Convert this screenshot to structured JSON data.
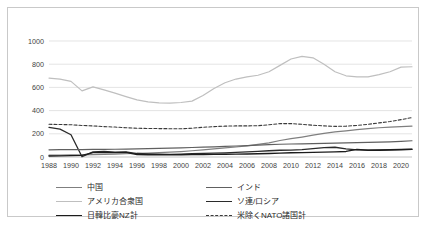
{
  "chart_data": {
    "type": "line",
    "title": "",
    "xlabel": "",
    "ylabel": "",
    "ylim": [
      0,
      1000
    ],
    "yticks": [
      0,
      200,
      400,
      600,
      800,
      1000
    ],
    "xlim": [
      1988,
      2021
    ],
    "grid": true,
    "legend_position": "bottom",
    "xtick_labels": [
      "1988",
      "1990",
      "1992",
      "1994",
      "1996",
      "1998",
      "2000",
      "2002",
      "2004",
      "2006",
      "2008",
      "2010",
      "2012",
      "2014",
      "2016",
      "2018",
      "2020"
    ],
    "x": [
      1988,
      1989,
      1990,
      1991,
      1992,
      1993,
      1994,
      1995,
      1996,
      1997,
      1998,
      1999,
      2000,
      2001,
      2002,
      2003,
      2004,
      2005,
      2006,
      2007,
      2008,
      2009,
      2010,
      2011,
      2012,
      2013,
      2014,
      2015,
      2016,
      2017,
      2018,
      2019,
      2020,
      2021
    ],
    "series": [
      {
        "name": "アメリカ合衆国",
        "key": "usa",
        "color": "#bfbfbf",
        "width": 1.2,
        "dash": "none",
        "values": [
          680,
          672,
          652,
          570,
          605,
          578,
          550,
          520,
          492,
          475,
          466,
          465,
          470,
          482,
          530,
          590,
          640,
          672,
          690,
          705,
          735,
          790,
          845,
          868,
          855,
          800,
          735,
          700,
          690,
          690,
          710,
          735,
          775,
          778
        ]
      },
      {
        "name": "米除くNATO諸国計",
        "key": "nato_ex_us",
        "color": "#3a3a3a",
        "width": 1.1,
        "dash": "3,2",
        "values": [
          282,
          280,
          278,
          272,
          268,
          262,
          258,
          252,
          248,
          246,
          245,
          244,
          243,
          248,
          256,
          262,
          266,
          268,
          268,
          270,
          278,
          288,
          288,
          282,
          274,
          268,
          264,
          266,
          272,
          282,
          294,
          306,
          322,
          340
        ]
      },
      {
        "name": "中国",
        "key": "china",
        "color": "#7f7f7f",
        "width": 1.2,
        "dash": "none",
        "values": [
          16,
          17,
          18,
          19,
          21,
          23,
          25,
          28,
          31,
          34,
          38,
          42,
          47,
          54,
          62,
          70,
          78,
          86,
          96,
          108,
          122,
          142,
          158,
          172,
          188,
          204,
          216,
          226,
          236,
          244,
          252,
          258,
          262,
          266
        ]
      },
      {
        "name": "ソ連/ロシア",
        "key": "ussr_russia",
        "color": "#2b2b2b",
        "width": 1.3,
        "dash": "none",
        "values": [
          255,
          240,
          192,
          2,
          44,
          48,
          42,
          44,
          30,
          26,
          24,
          23,
          25,
          28,
          32,
          34,
          36,
          40,
          44,
          48,
          54,
          58,
          60,
          64,
          72,
          80,
          84,
          70,
          62,
          60,
          62,
          64,
          66,
          68
        ]
      },
      {
        "name": "インド",
        "key": "india",
        "color": "#606060",
        "width": 1.2,
        "dash": "none",
        "values": [
          62,
          63,
          64,
          64,
          65,
          66,
          67,
          68,
          70,
          72,
          74,
          76,
          79,
          82,
          85,
          88,
          92,
          95,
          98,
          102,
          106,
          110,
          112,
          114,
          116,
          118,
          120,
          122,
          124,
          126,
          128,
          131,
          135,
          140
        ]
      },
      {
        "name": "日韓比豪NZ計",
        "key": "japan_group",
        "color": "#1c1c1c",
        "width": 1.4,
        "dash": "none",
        "values": [
          8,
          10,
          12,
          14,
          38,
          40,
          38,
          40,
          22,
          20,
          19,
          19,
          20,
          21,
          22,
          23,
          24,
          25,
          26,
          28,
          30,
          33,
          36,
          38,
          40,
          42,
          44,
          48,
          66,
          58,
          58,
          60,
          62,
          66
        ]
      }
    ]
  },
  "legend": {
    "columns": [
      [
        {
          "label": "中国",
          "key": "china"
        },
        {
          "label": "アメリカ合衆国",
          "key": "usa"
        },
        {
          "label": "日韓比豪NZ計",
          "key": "japan_group"
        }
      ],
      [
        {
          "label": "インド",
          "key": "india"
        },
        {
          "label": "ソ連/ロシア",
          "key": "ussr_russia"
        },
        {
          "label": "米除くNATO諸国計",
          "key": "nato_ex_us"
        }
      ]
    ]
  }
}
